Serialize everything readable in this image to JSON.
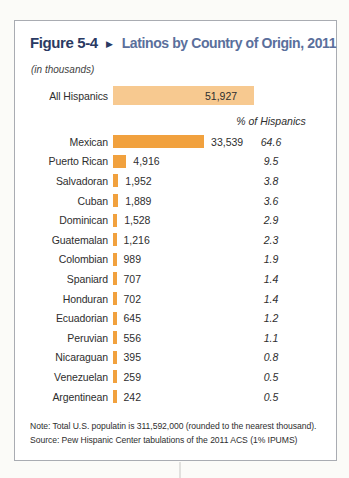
{
  "figure": {
    "label": "Figure 5-4",
    "arrow_icon": "▶",
    "title": "Latinos by Country of Origin, 2011",
    "units": "(in thousands)"
  },
  "chart_data": {
    "type": "bar",
    "orientation": "horizontal",
    "title": "Latinos by Country of Origin, 2011",
    "units": "thousands",
    "xlim": [
      0,
      51927
    ],
    "grid": false,
    "total": {
      "label": "All Hispanics",
      "value": 51927,
      "value_label": "51,927"
    },
    "percent_header": "% of Hispanics",
    "rows": [
      {
        "label": "Mexican",
        "value": 33539,
        "value_label": "33,539",
        "pct": 64.6,
        "pct_label": "64.6"
      },
      {
        "label": "Puerto Rican",
        "value": 4916,
        "value_label": "4,916",
        "pct": 9.5,
        "pct_label": "9.5"
      },
      {
        "label": "Salvadoran",
        "value": 1952,
        "value_label": "1,952",
        "pct": 3.8,
        "pct_label": "3.8"
      },
      {
        "label": "Cuban",
        "value": 1889,
        "value_label": "1,889",
        "pct": 3.6,
        "pct_label": "3.6"
      },
      {
        "label": "Dominican",
        "value": 1528,
        "value_label": "1,528",
        "pct": 2.9,
        "pct_label": "2.9"
      },
      {
        "label": "Guatemalan",
        "value": 1216,
        "value_label": "1,216",
        "pct": 2.3,
        "pct_label": "2.3"
      },
      {
        "label": "Colombian",
        "value": 989,
        "value_label": "989",
        "pct": 1.9,
        "pct_label": "1.9"
      },
      {
        "label": "Spaniard",
        "value": 707,
        "value_label": "707",
        "pct": 1.4,
        "pct_label": "1.4"
      },
      {
        "label": "Honduran",
        "value": 702,
        "value_label": "702",
        "pct": 1.4,
        "pct_label": "1.4"
      },
      {
        "label": "Ecuadorian",
        "value": 645,
        "value_label": "645",
        "pct": 1.2,
        "pct_label": "1.2"
      },
      {
        "label": "Peruvian",
        "value": 556,
        "value_label": "556",
        "pct": 1.1,
        "pct_label": "1.1"
      },
      {
        "label": "Nicaraguan",
        "value": 395,
        "value_label": "395",
        "pct": 0.8,
        "pct_label": "0.8"
      },
      {
        "label": "Venezuelan",
        "value": 259,
        "value_label": "259",
        "pct": 0.5,
        "pct_label": "0.5"
      },
      {
        "label": "Argentinean",
        "value": 242,
        "value_label": "242",
        "pct": 0.5,
        "pct_label": "0.5"
      }
    ],
    "colors": {
      "total_bar": "#f7c990",
      "category_bar": "#f1a13e",
      "title_navy": "#2a3a63",
      "title_blue": "#5a6f9c",
      "text": "#2e2e2e"
    }
  },
  "notes": {
    "note": "Note: Total U.S. populatin is 311,592,000 (rounded to the nearest thousand).",
    "source": "Source: Pew Hispanic Center tabulations of the 2011 ACS (1% IPUMS)"
  }
}
